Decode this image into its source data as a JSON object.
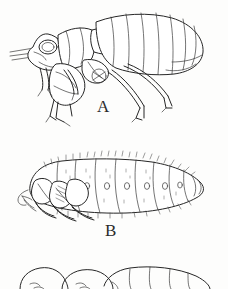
{
  "plate": {
    "title": "Insect life stages illustration plate",
    "background_color": "#fdfdfc",
    "ink_color": "#262626",
    "width": 228,
    "height": 289,
    "style": "line drawing / scanned ink illustration"
  },
  "figures": [
    {
      "id": "figure-a",
      "label": "A",
      "label_x": 105,
      "label_y": 108,
      "caption": "A",
      "subject": "adult insect, lateral view",
      "features": [
        "head with compound eye",
        "antenna",
        "enlarged hind femur",
        "segmented abdomen",
        "three pairs of legs with tarsal claws"
      ],
      "abdominal_segments": 8
    },
    {
      "id": "figure-b",
      "label": "B",
      "label_x": 113,
      "label_y": 232,
      "caption": "B",
      "subject": "pupa / larval stage, lateral view",
      "features": [
        "folded anterior appendages",
        "segmented body with spiracles",
        "tapered posterior",
        "marginal bristles"
      ],
      "abdominal_segments": 7,
      "spiracle_count": 6
    },
    {
      "id": "figure-c",
      "label": "",
      "label_x": 0,
      "label_y": 0,
      "caption": "",
      "subject": "third stage, cropped at page edge",
      "features": [
        "partially visible segmented body",
        "cut off by page boundary"
      ],
      "abdominal_segments": 5
    }
  ]
}
